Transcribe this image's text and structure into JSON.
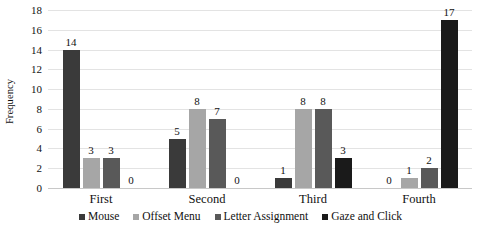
{
  "chart_data": {
    "type": "bar",
    "title": "",
    "xlabel": "",
    "ylabel": "Frequency",
    "ylim": [
      0,
      18
    ],
    "ytick_step": 2,
    "yticks": [
      18,
      16,
      14,
      12,
      10,
      8,
      6,
      4,
      2,
      0
    ],
    "grid": true,
    "legend_position": "bottom",
    "categories": [
      "First",
      "Second",
      "Third",
      "Fourth"
    ],
    "series": [
      {
        "name": "Mouse",
        "color": "#3a3a3a",
        "values": [
          14,
          5,
          1,
          0
        ]
      },
      {
        "name": "Offset Menu",
        "color": "#a6a6a6",
        "values": [
          3,
          8,
          8,
          1
        ]
      },
      {
        "name": "Letter Assignment",
        "color": "#595959",
        "values": [
          3,
          7,
          8,
          2
        ]
      },
      {
        "name": "Gaze and Click",
        "color": "#1a1a1a",
        "values": [
          0,
          0,
          3,
          17
        ]
      }
    ],
    "data_labels": [
      [
        "14",
        "3",
        "3",
        "0"
      ],
      [
        "5",
        "8",
        "7",
        "0"
      ],
      [
        "1",
        "8",
        "8",
        "3"
      ],
      [
        "0",
        "1",
        "2",
        "17"
      ]
    ]
  }
}
